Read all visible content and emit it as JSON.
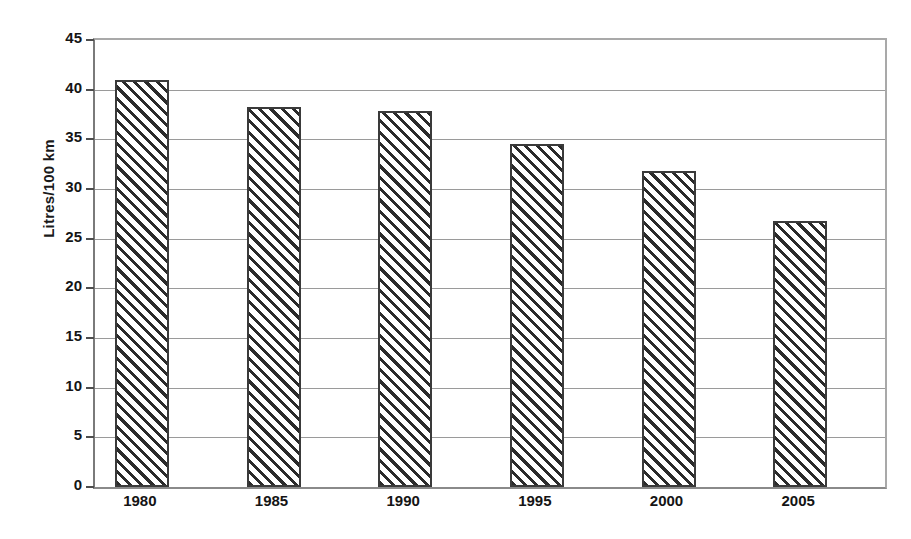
{
  "chart_data": {
    "type": "bar",
    "title": "",
    "subtitle": "",
    "xlabel": "",
    "ylabel": "Litres/100 km",
    "categories": [
      "1980",
      "1985",
      "1990",
      "1995",
      "2000",
      "2005"
    ],
    "values": [
      41.0,
      38.3,
      37.9,
      34.5,
      31.8,
      26.8
    ],
    "ylim": [
      0,
      45
    ],
    "ytick_step": 5,
    "ytick_labels": [
      "45",
      "40",
      "35",
      "30",
      "25",
      "20",
      "15",
      "10",
      "5",
      "0"
    ],
    "ytick_values": [
      45,
      40,
      35,
      30,
      25,
      20,
      15,
      10,
      5,
      0
    ],
    "grid": true,
    "grid_axis": "y",
    "legend": false,
    "legend_position": "none",
    "annotations": [],
    "style": {
      "bar_fill": "#ffffff",
      "bar_hatch": "diagonal-forward-slash",
      "bar_hatch_color": "#2b2b2b",
      "bar_edge": "#3a3a3a",
      "gridline_color": "#9a9a9a",
      "axis_color": "#7a7a7a",
      "text_color": "#141414",
      "background": "#ffffff"
    }
  }
}
